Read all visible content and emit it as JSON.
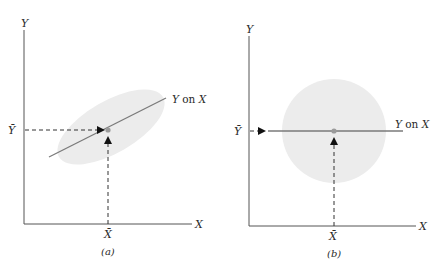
{
  "colors": {
    "axis": "#555555",
    "regression_line": "#7a7a7a",
    "scatter_region": "#ececec",
    "dashed_guide": "#333333",
    "arrow": "#111111",
    "mean_point": "#9a9a9a"
  },
  "panels": [
    {
      "id": "a",
      "caption": "(a)",
      "y_axis_label": "Y",
      "x_axis_label": "X",
      "y_mean_label": "Ȳ",
      "x_mean_label": "X̄",
      "regression_label_y": "Y",
      "regression_label_on": " on ",
      "regression_label_x": "X",
      "scatter_shape": "ellipse",
      "correlation": "positive"
    },
    {
      "id": "b",
      "caption": "(b)",
      "y_axis_label": "Y",
      "x_axis_label": "X",
      "y_mean_label": "Ȳ",
      "x_mean_label": "X̄",
      "regression_label_y": "Y",
      "regression_label_on": " on ",
      "regression_label_x": "X",
      "scatter_shape": "circle",
      "correlation": "zero"
    }
  ]
}
